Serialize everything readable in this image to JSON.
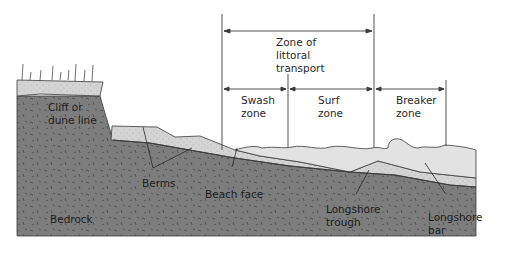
{
  "diagram": {
    "zones": {
      "littoral": [
        "Zone of",
        "littoral",
        "transport"
      ],
      "swash": [
        "Swash",
        "zone"
      ],
      "surf": [
        "Surf",
        "zone"
      ],
      "breaker": [
        "Breaker",
        "zone"
      ]
    },
    "labels": {
      "cliff": [
        "Cliff or",
        "dune line"
      ],
      "berms": "Berms",
      "beach_face": "Beach face",
      "bedrock": "Bedrock",
      "longshore_trough": [
        "Longshore",
        "trough"
      ],
      "longshore_bar": [
        "Longshore",
        "bar"
      ]
    },
    "colors": {
      "bedrock": "#7d7d7d",
      "sediment": "#d3d3d3",
      "water": "#e2e2e2",
      "line": "#3a3a3a",
      "text": "#1e1e1e"
    }
  }
}
